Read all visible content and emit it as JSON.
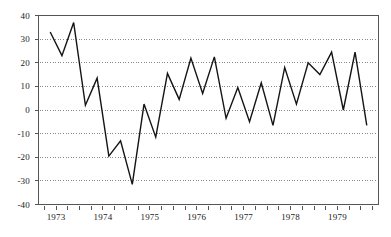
{
  "chart_data": {
    "type": "line",
    "title": "",
    "subtitle": "",
    "xlabel": "",
    "ylabel": "",
    "ylim": [
      -40,
      40
    ],
    "xlim": [
      1972.625,
      1979.875
    ],
    "grid": true,
    "grid_style": "dotted-horizontal",
    "legend": "none",
    "yticks": [
      40,
      30,
      20,
      10,
      0,
      -10,
      -20,
      -30,
      -40
    ],
    "ytick_labels": [
      "40",
      "30",
      "20",
      "10",
      "0",
      "-10",
      "-20",
      "-30",
      "-40"
    ],
    "xticks": [
      1973,
      1974,
      1975,
      1976,
      1977,
      1978,
      1979
    ],
    "xtick_labels": [
      "1973",
      "1974",
      "1975",
      "1976",
      "1977",
      "1978",
      "1979"
    ],
    "x_minor_interval": 0.25,
    "x": [
      1972.875,
      1973.125,
      1973.375,
      1973.625,
      1973.875,
      1974.125,
      1974.375,
      1974.625,
      1974.875,
      1975.125,
      1975.375,
      1975.625,
      1975.875,
      1976.125,
      1976.375,
      1976.625,
      1976.875,
      1977.125,
      1977.375,
      1977.625,
      1977.875,
      1978.125,
      1978.375,
      1978.625,
      1978.875,
      1979.125,
      1979.375,
      1979.625
    ],
    "values": [
      33,
      23,
      37,
      2,
      13.5,
      -19.5,
      -13,
      -31.5,
      2.5,
      -11.5,
      15.5,
      4.5,
      22,
      7,
      22.5,
      -3.5,
      9.5,
      -5,
      11.5,
      -6.5,
      18,
      2.5,
      20,
      15,
      24.5,
      0,
      24.5,
      -6.5
    ],
    "series": [
      {
        "name": "series-1",
        "color": "#141414",
        "line_width": 1.4,
        "markers": "none",
        "values": [
          33,
          23,
          37,
          2,
          13.5,
          -19.5,
          -13,
          -31.5,
          2.5,
          -11.5,
          15.5,
          4.5,
          22,
          7,
          22.5,
          -3.5,
          9.5,
          -5,
          11.5,
          -6.5,
          18,
          2.5,
          20,
          15,
          24.5,
          0,
          24.5,
          -6.5
        ]
      }
    ],
    "colors": {
      "line": "#141414",
      "axis": "#555555",
      "grid": "#8a8a8a",
      "background": "#ffffff",
      "text": "#1a1a1a"
    }
  }
}
